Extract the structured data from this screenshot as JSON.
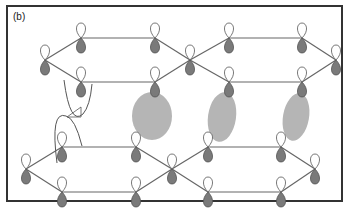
{
  "figure": {
    "panel_label": "(b)",
    "frame": {
      "x": 7,
      "y": 6,
      "width": 335,
      "height": 195
    },
    "colors": {
      "frame": "#333333",
      "bond": "#666666",
      "lobe_top_fill": "#ffffff",
      "lobe_bottom_fill": "#7a7a7a",
      "lobe_stroke": "#555555",
      "ellipse_fill": "#b5b5b5",
      "curve": "#555555"
    },
    "upper_sheet": {
      "nodes": [
        {
          "x": 45,
          "y": 60
        },
        {
          "x": 81,
          "y": 38
        },
        {
          "x": 155,
          "y": 38
        },
        {
          "x": 190,
          "y": 60
        },
        {
          "x": 229,
          "y": 38
        },
        {
          "x": 302,
          "y": 38
        },
        {
          "x": 336,
          "y": 60
        },
        {
          "x": 81,
          "y": 82
        },
        {
          "x": 155,
          "y": 82
        },
        {
          "x": 229,
          "y": 82
        },
        {
          "x": 302,
          "y": 82
        }
      ],
      "bonds": [
        [
          0,
          1
        ],
        [
          1,
          2
        ],
        [
          2,
          3
        ],
        [
          3,
          4
        ],
        [
          4,
          5
        ],
        [
          5,
          6
        ],
        [
          0,
          7
        ],
        [
          7,
          8
        ],
        [
          8,
          3
        ],
        [
          3,
          9
        ],
        [
          9,
          10
        ],
        [
          10,
          6
        ]
      ]
    },
    "lower_sheet": {
      "nodes": [
        {
          "x": 26,
          "y": 169
        },
        {
          "x": 62,
          "y": 147
        },
        {
          "x": 136,
          "y": 147
        },
        {
          "x": 172,
          "y": 169
        },
        {
          "x": 208,
          "y": 147
        },
        {
          "x": 281,
          "y": 147
        },
        {
          "x": 315,
          "y": 169
        },
        {
          "x": 62,
          "y": 192
        },
        {
          "x": 136,
          "y": 192
        },
        {
          "x": 208,
          "y": 192
        },
        {
          "x": 281,
          "y": 192
        }
      ],
      "bonds": [
        [
          0,
          1
        ],
        [
          1,
          2
        ],
        [
          2,
          3
        ],
        [
          3,
          4
        ],
        [
          4,
          5
        ],
        [
          5,
          6
        ],
        [
          0,
          7
        ],
        [
          7,
          8
        ],
        [
          8,
          3
        ],
        [
          3,
          9
        ],
        [
          9,
          10
        ],
        [
          10,
          6
        ]
      ]
    },
    "ellipses": [
      {
        "cx": 152,
        "cy": 116,
        "rx": 20,
        "ry": 24,
        "rotate": 0
      },
      {
        "cx": 222,
        "cy": 117,
        "rx": 14,
        "ry": 25,
        "rotate": 8
      },
      {
        "cx": 296,
        "cy": 117,
        "rx": 13,
        "ry": 24,
        "rotate": 10
      }
    ],
    "potential_curves": [
      {
        "d": "M 64 80 Q 70 126 83 114 Q 90 106 92 84"
      },
      {
        "d": "M 57 163 Q 50 110 66 116 Q 75 118 82 146"
      }
    ],
    "annotation_lines": [
      {
        "d": "M 67 117 L 81 107 L 81 117 L 67 117"
      }
    ]
  }
}
